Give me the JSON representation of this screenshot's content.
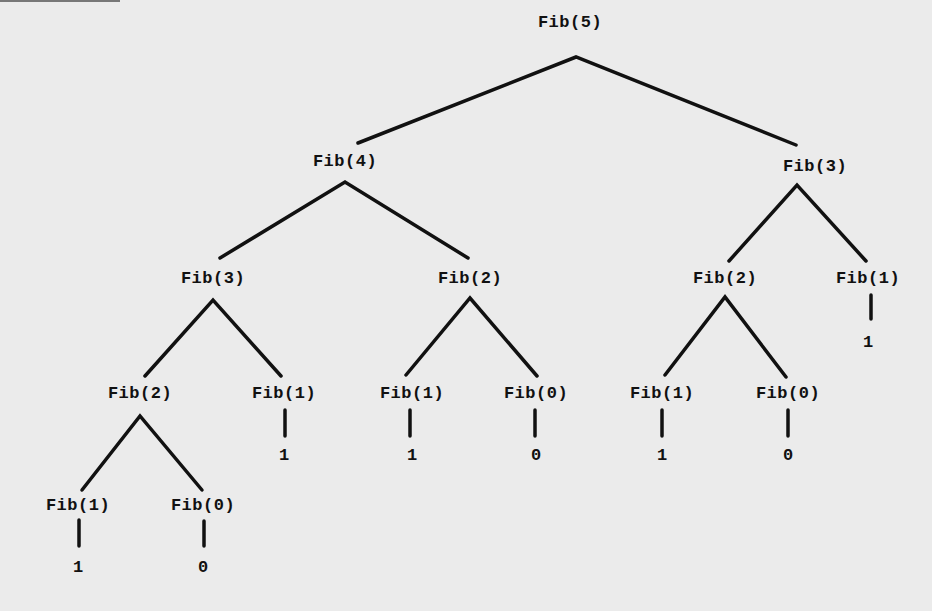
{
  "diagram": {
    "nodes": [
      {
        "id": "n0",
        "label": "Fib(5)",
        "x": 570,
        "y": 13
      },
      {
        "id": "n1",
        "label": "Fib(4)",
        "x": 345,
        "y": 152
      },
      {
        "id": "n2",
        "label": "Fib(3)",
        "x": 815,
        "y": 157
      },
      {
        "id": "n3",
        "label": "Fib(3)",
        "x": 213,
        "y": 269
      },
      {
        "id": "n4",
        "label": "Fib(2)",
        "x": 470,
        "y": 269
      },
      {
        "id": "n5",
        "label": "Fib(2)",
        "x": 725,
        "y": 269
      },
      {
        "id": "n6",
        "label": "Fib(1)",
        "x": 868,
        "y": 269
      },
      {
        "id": "n7",
        "label": "Fib(2)",
        "x": 140,
        "y": 384
      },
      {
        "id": "n8",
        "label": "Fib(1)",
        "x": 284,
        "y": 384
      },
      {
        "id": "n9",
        "label": "Fib(1)",
        "x": 412,
        "y": 384
      },
      {
        "id": "n10",
        "label": "Fib(0)",
        "x": 536,
        "y": 384
      },
      {
        "id": "n11",
        "label": "Fib(1)",
        "x": 662,
        "y": 384
      },
      {
        "id": "n12",
        "label": "Fib(0)",
        "x": 788,
        "y": 384
      },
      {
        "id": "n13",
        "label": "Fib(1)",
        "x": 78,
        "y": 496
      },
      {
        "id": "n14",
        "label": "Fib(0)",
        "x": 203,
        "y": 496
      }
    ],
    "leaves": [
      {
        "label": "1",
        "x": 868,
        "y": 333
      },
      {
        "label": "1",
        "x": 284,
        "y": 446
      },
      {
        "label": "1",
        "x": 412,
        "y": 446
      },
      {
        "label": "0",
        "x": 536,
        "y": 446
      },
      {
        "label": "1",
        "x": 662,
        "y": 446
      },
      {
        "label": "0",
        "x": 788,
        "y": 446
      },
      {
        "label": "1",
        "x": 78,
        "y": 558
      },
      {
        "label": "0",
        "x": 203,
        "y": 558
      }
    ]
  }
}
